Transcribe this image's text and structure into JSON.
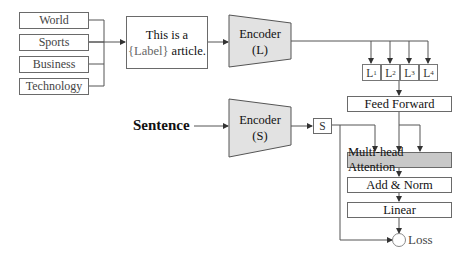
{
  "labels": [
    "World",
    "Sports",
    "Business",
    "Technology"
  ],
  "template": {
    "line1": "This is a",
    "placeholder": "{Label}",
    "line2_suffix": " article."
  },
  "encoder_label": {
    "title": "Encoder",
    "sub": "(L)"
  },
  "encoder_sentence": {
    "title": "Encoder",
    "sub": "(S)"
  },
  "input": "Sentence",
  "label_embeddings": [
    {
      "base": "L",
      "index": "1"
    },
    {
      "base": "L",
      "index": "2"
    },
    {
      "base": "L",
      "index": "3"
    },
    {
      "base": "L",
      "index": "4"
    }
  ],
  "sentence_embedding": "S",
  "layers": {
    "feed_forward": "Feed Forward",
    "attention": "Multi-head Attention",
    "add_norm": "Add & Norm",
    "linear": "Linear"
  },
  "output": "Loss",
  "colors": {
    "encoder_fill": "#e2e2e2",
    "attention_fill": "#c8c8c8",
    "line": "#555555"
  }
}
